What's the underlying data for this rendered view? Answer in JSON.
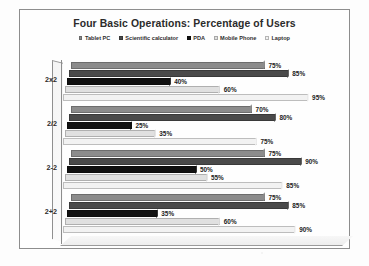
{
  "chart_data": {
    "type": "bar",
    "orientation": "horizontal",
    "style": "3d-clustered-bar",
    "title": "Four Basic Operations: Percentage of Users",
    "xlabel": "",
    "ylabel": "",
    "xlim": [
      0,
      100
    ],
    "grid": false,
    "legend_position": "top",
    "value_suffix": "%",
    "categories": [
      "2x2",
      "2/2",
      "2-2",
      "2+2"
    ],
    "series": [
      {
        "name": "Tablet PC",
        "color": "#8c8c8c",
        "values": [
          75,
          70,
          75,
          75
        ]
      },
      {
        "name": "Scientific calculator",
        "color": "#4a4a4a",
        "values": [
          85,
          80,
          90,
          85
        ]
      },
      {
        "name": "PDA",
        "color": "#111111",
        "values": [
          40,
          25,
          50,
          35
        ]
      },
      {
        "name": "Mobile Phone",
        "color": "#e0e0e0",
        "values": [
          60,
          35,
          55,
          60
        ]
      },
      {
        "name": "Laptop",
        "color": "#f2f2f2",
        "values": [
          95,
          75,
          85,
          90
        ]
      }
    ],
    "data_labels": {
      "2x2": [
        "75%",
        "85%",
        "40%",
        "60%",
        "95%"
      ],
      "2/2": [
        "70%",
        "80%",
        "25%",
        "35%",
        "75%"
      ],
      "2-2": [
        "75%",
        "90%",
        "50%",
        "55%",
        "85%"
      ],
      "2+2": [
        "75%",
        "85%",
        "35%",
        "60%",
        "90%"
      ]
    }
  },
  "legend": {
    "items": [
      {
        "label": "Tablet PC"
      },
      {
        "label": "Scientific calculator"
      },
      {
        "label": "PDA"
      },
      {
        "label": "Mobile Phone"
      },
      {
        "label": "Laptop"
      }
    ]
  }
}
